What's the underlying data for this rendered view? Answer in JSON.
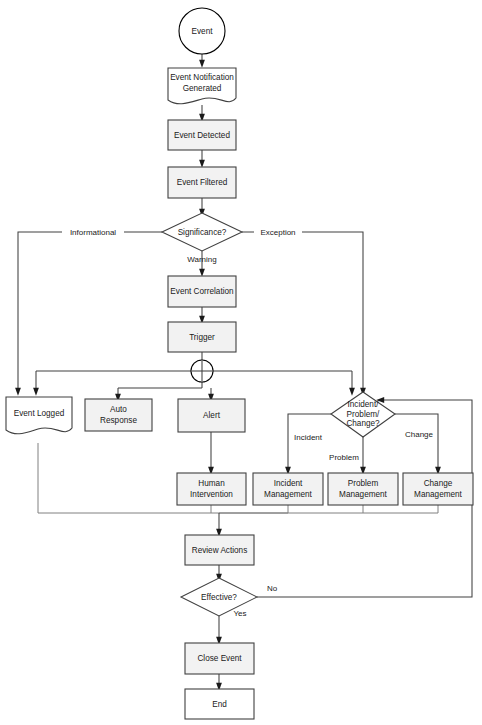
{
  "diagram": {
    "colors": {
      "node_fill": "#f2f2f2",
      "node_stroke": "#404040",
      "decision_fill": "#ffffff",
      "line": "#404040",
      "text": "#1a1a1a",
      "background": "#ffffff"
    },
    "nodes": {
      "event": {
        "label": "Event",
        "shape": "circle"
      },
      "event_notification_generated": {
        "label_line1": "Event Notification",
        "label_line2": "Generated",
        "shape": "document"
      },
      "event_detected": {
        "label": "Event Detected",
        "shape": "process"
      },
      "event_filtered": {
        "label": "Event Filtered",
        "shape": "process"
      },
      "significance": {
        "label": "Significance?",
        "shape": "decision"
      },
      "event_correlation": {
        "label": "Event Correlation",
        "shape": "process"
      },
      "trigger": {
        "label": "Trigger",
        "shape": "process"
      },
      "junction": {
        "label": "",
        "shape": "cross-circle"
      },
      "event_logged": {
        "label": "Event Logged",
        "shape": "document"
      },
      "auto_response": {
        "label_line1": "Auto",
        "label_line2": "Response",
        "shape": "process"
      },
      "alert": {
        "label": "Alert",
        "shape": "process"
      },
      "ipc_decision": {
        "label_line1": "Incident/",
        "label_line2": "Problem/",
        "label_line3": "Change?",
        "shape": "decision"
      },
      "human_intervention": {
        "label_line1": "Human",
        "label_line2": "Intervention",
        "shape": "process"
      },
      "incident_management": {
        "label_line1": "Incident",
        "label_line2": "Management",
        "shape": "process"
      },
      "problem_management": {
        "label_line1": "Problem",
        "label_line2": "Management",
        "shape": "process"
      },
      "change_management": {
        "label_line1": "Change",
        "label_line2": "Management",
        "shape": "process"
      },
      "review_actions": {
        "label": "Review Actions",
        "shape": "process"
      },
      "effective": {
        "label": "Effective?",
        "shape": "decision"
      },
      "close_event": {
        "label": "Close Event",
        "shape": "process"
      },
      "end": {
        "label": "End",
        "shape": "process"
      }
    },
    "edge_labels": {
      "informational": "Informational",
      "exception": "Exception",
      "warning": "Warning",
      "incident": "Incident",
      "problem": "Problem",
      "change": "Change",
      "no": "No",
      "yes": "Yes"
    }
  }
}
